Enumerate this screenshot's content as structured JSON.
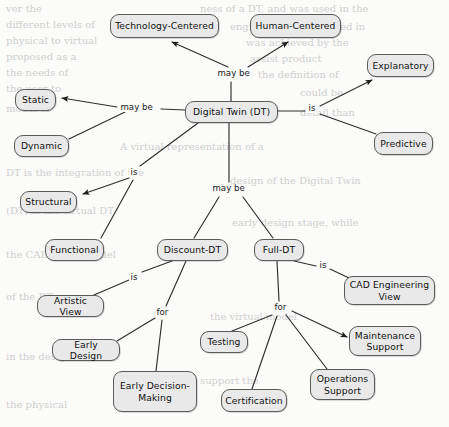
{
  "diagram": {
    "type": "concept-map",
    "background_color": "#fbfbfa",
    "node_fill": "#e9e9e9",
    "node_border": "#5b5b5b",
    "nodes": [
      {
        "id": "tech_centered",
        "label": "Technology-Centered",
        "x": 110,
        "y": 14,
        "w": 109,
        "h": 24
      },
      {
        "id": "human_centered",
        "label": "Human-Centered",
        "x": 250,
        "y": 14,
        "w": 91,
        "h": 24
      },
      {
        "id": "explanatory",
        "label": "Explanatory",
        "x": 367,
        "y": 54,
        "w": 67,
        "h": 23
      },
      {
        "id": "static",
        "label": "Static",
        "x": 15,
        "y": 89,
        "w": 41,
        "h": 22
      },
      {
        "id": "digital_twin",
        "label": "Digital Twin (DT)",
        "x": 185,
        "y": 101,
        "w": 93,
        "h": 22
      },
      {
        "id": "predictive",
        "label": "Predictive",
        "x": 374,
        "y": 132,
        "w": 59,
        "h": 23
      },
      {
        "id": "dynamic",
        "label": "Dynamic",
        "x": 14,
        "y": 135,
        "w": 55,
        "h": 22
      },
      {
        "id": "structural",
        "label": "Structural",
        "x": 20,
        "y": 191,
        "w": 57,
        "h": 22
      },
      {
        "id": "functional",
        "label": "Functional",
        "x": 45,
        "y": 239,
        "w": 59,
        "h": 22
      },
      {
        "id": "discount_dt",
        "label": "Discount-DT",
        "x": 157,
        "y": 239,
        "w": 71,
        "h": 22
      },
      {
        "id": "full_dt",
        "label": "Full-DT",
        "x": 254,
        "y": 239,
        "w": 50,
        "h": 22
      },
      {
        "id": "cad_eng_view",
        "label": "CAD Engineering View",
        "x": 344,
        "y": 276,
        "w": 91,
        "h": 29
      },
      {
        "id": "artistic_view",
        "label": "Artistic View",
        "x": 37,
        "y": 295,
        "w": 67,
        "h": 22
      },
      {
        "id": "maintenance",
        "label": "Maintenance Support",
        "x": 349,
        "y": 326,
        "w": 72,
        "h": 30
      },
      {
        "id": "testing",
        "label": "Testing",
        "x": 200,
        "y": 331,
        "w": 48,
        "h": 22
      },
      {
        "id": "early_design",
        "label": "Early Design",
        "x": 52,
        "y": 339,
        "w": 68,
        "h": 22
      },
      {
        "id": "operations",
        "label": "Operations Support",
        "x": 310,
        "y": 369,
        "w": 65,
        "h": 31
      },
      {
        "id": "early_decision",
        "label": "Early Decision-Making",
        "x": 113,
        "y": 371,
        "w": 84,
        "h": 41
      },
      {
        "id": "certification",
        "label": "Certification",
        "x": 221,
        "y": 389,
        "w": 66,
        "h": 23
      }
    ],
    "edge_labels": [
      {
        "id": "maybe_top",
        "text": "may be",
        "x": 216,
        "y": 69
      },
      {
        "id": "maybe_left",
        "text": "may be",
        "x": 119,
        "y": 103
      },
      {
        "id": "is_right",
        "text": "is",
        "x": 307,
        "y": 104
      },
      {
        "id": "is_left",
        "text": "is",
        "x": 129,
        "y": 168
      },
      {
        "id": "maybe_bottom",
        "text": "may be",
        "x": 211,
        "y": 184
      },
      {
        "id": "is_discount",
        "text": "is",
        "x": 129,
        "y": 273
      },
      {
        "id": "is_full",
        "text": "is",
        "x": 318,
        "y": 261
      },
      {
        "id": "for_full",
        "text": "for",
        "x": 273,
        "y": 303
      },
      {
        "id": "for_discount",
        "text": "for",
        "x": 155,
        "y": 308
      }
    ],
    "edges": [
      {
        "from": "digital_twin",
        "to": "tech_centered",
        "relation": "may be",
        "arrow": true
      },
      {
        "from": "digital_twin",
        "to": "human_centered",
        "relation": "may be",
        "arrow": true
      },
      {
        "from": "digital_twin",
        "to": "explanatory",
        "relation": "is",
        "arrow": true
      },
      {
        "from": "digital_twin",
        "to": "predictive",
        "relation": "is",
        "arrow": false
      },
      {
        "from": "digital_twin",
        "to": "static",
        "relation": "may be",
        "arrow": true
      },
      {
        "from": "digital_twin",
        "to": "dynamic",
        "relation": "may be",
        "arrow": false
      },
      {
        "from": "digital_twin",
        "to": "structural",
        "relation": "is",
        "arrow": true
      },
      {
        "from": "digital_twin",
        "to": "functional",
        "relation": "is",
        "arrow": false
      },
      {
        "from": "digital_twin",
        "to": "discount_dt",
        "relation": "may be",
        "arrow": false
      },
      {
        "from": "digital_twin",
        "to": "full_dt",
        "relation": "may be",
        "arrow": false
      },
      {
        "from": "discount_dt",
        "to": "artistic_view",
        "relation": "is",
        "arrow": false
      },
      {
        "from": "discount_dt",
        "to": "early_design",
        "relation": "for",
        "arrow": false
      },
      {
        "from": "discount_dt",
        "to": "early_decision",
        "relation": "for",
        "arrow": false
      },
      {
        "from": "full_dt",
        "to": "cad_eng_view",
        "relation": "is",
        "arrow": false
      },
      {
        "from": "full_dt",
        "to": "testing",
        "relation": "for",
        "arrow": false
      },
      {
        "from": "full_dt",
        "to": "certification",
        "relation": "for",
        "arrow": false
      },
      {
        "from": "full_dt",
        "to": "operations",
        "relation": "for",
        "arrow": false
      },
      {
        "from": "full_dt",
        "to": "maintenance",
        "relation": "for",
        "arrow": true
      }
    ]
  },
  "watermark": {
    "description": "faint scanned page text showing through the background",
    "lines": [
      "ver the",
      "ness of a DT, and was used in the",
      "different levels of",
      "engineering model used in",
      "physical to virtual",
      "was achieved by the",
      "proposed as a",
      "assist product",
      "the needs of",
      "the definition of",
      "the user to",
      "could be",
      "model of",
      "detail than",
      "A virtual representation of a",
      "DT is the integration of the",
      "design of the Digital Twin",
      "(DT) is the virtual DT",
      "early design stage, while",
      "the CAD-based model"
    ]
  }
}
